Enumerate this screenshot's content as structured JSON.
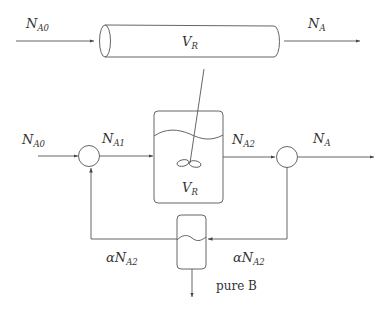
{
  "diagram": {
    "pfr": {
      "inlet": {
        "main": "N",
        "sub": "A0"
      },
      "volume": {
        "main": "V",
        "sub": "R"
      },
      "outlet": {
        "main": "N",
        "sub": "A"
      }
    },
    "cstr_system": {
      "feed": {
        "main": "N",
        "sub": "A0"
      },
      "mixed_feed": {
        "main": "N",
        "sub": "A1"
      },
      "reactor_volume": {
        "main": "V",
        "sub": "R"
      },
      "reactor_outlet": {
        "main": "N",
        "sub": "A2"
      },
      "product": {
        "main": "N",
        "sub": "A"
      },
      "split_stream": {
        "prefix": "α",
        "main": "N",
        "sub": "A2"
      },
      "recycle_stream": {
        "prefix": "α",
        "main": "N",
        "sub": "A2"
      },
      "separator_outlet": "pure B"
    },
    "colors": {
      "line": "#555555",
      "text": "#333333",
      "background": "#ffffff"
    }
  }
}
